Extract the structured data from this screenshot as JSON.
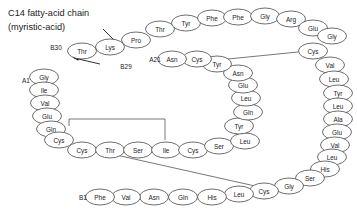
{
  "figure": {
    "title_line1": "C14 fatty-acid chain",
    "title_line2": "(myristic-acid)"
  },
  "terminus_labels": {
    "a1": "A1",
    "a21": "A21",
    "b1": "B1",
    "b29": "B29",
    "b30": "B30"
  },
  "residues": {
    "b30_thr": "Thr",
    "b29_lys": "Lys",
    "b28_pro": "Pro",
    "b27_thr": "Thr",
    "b26_tyr": "Tyr",
    "b25_phe": "Phe",
    "b24_phe": "Phe",
    "b23_gly": "Gly",
    "b22_arg": "Arg",
    "b21_glu": "Glu",
    "b20_gly": "Gly",
    "b19_cys": "Cys",
    "b18_val": "Val",
    "b17_leu": "Leu",
    "b16_tyr": "Tyr",
    "b15_leu": "Leu",
    "b14_ala": "Ala",
    "b13_glu": "Glu",
    "b12_val": "Val",
    "b11_leu": "Leu",
    "b10_his": "His",
    "b9_ser": "Ser",
    "b8_gly": "Gly",
    "b7_cys": "Cys",
    "b6_leu": "Leu",
    "b5_his": "His",
    "b4_gln": "Gln",
    "b3_asn": "Asn",
    "b2_val": "Val",
    "b1_phe": "Phe",
    "a1_gly": "Gly",
    "a2_ile": "Ile",
    "a3_val": "Val",
    "a4_glu": "Glu",
    "a5_gln": "Gln",
    "a6_cys": "Cys",
    "a7_cys": "Cys",
    "a8_thr": "Thr",
    "a9_ser": "Ser",
    "a10_ile": "Ile",
    "a11_cys": "Cys",
    "a12_ser": "Ser",
    "a13_leu": "Leu",
    "a14_tyr": "Tyr",
    "a15_gln": "Gln",
    "a16_leu": "Leu",
    "a17_glu": "Glu",
    "a18_asn": "Asn",
    "a19_tyr": "Tyr",
    "a20_cys": "Cys",
    "a21_asn": "Asn"
  },
  "colors": {
    "outline": "#3d3d3d",
    "text": "#1a1a1a",
    "fill": "#ffffff",
    "background": "#ffffff"
  }
}
